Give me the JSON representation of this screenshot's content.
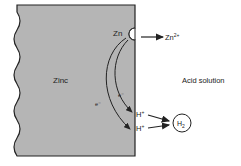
{
  "diagram": {
    "metal_label": "Zinc",
    "solution_label": "Acid solution",
    "anode_site_label": "Zn",
    "ion_product": {
      "base": "Zn",
      "sup": "2+"
    },
    "electron_labels": [
      "e⁻",
      "e⁻"
    ],
    "proton_labels": [
      {
        "base": "H",
        "sup": "+"
      },
      {
        "base": "H",
        "sup": "+"
      }
    ],
    "gas_product": {
      "base": "H",
      "sub": "2"
    },
    "colors": {
      "metal_fill": "#b5b5b5",
      "stroke": "#222222",
      "background": "#ffffff"
    }
  }
}
